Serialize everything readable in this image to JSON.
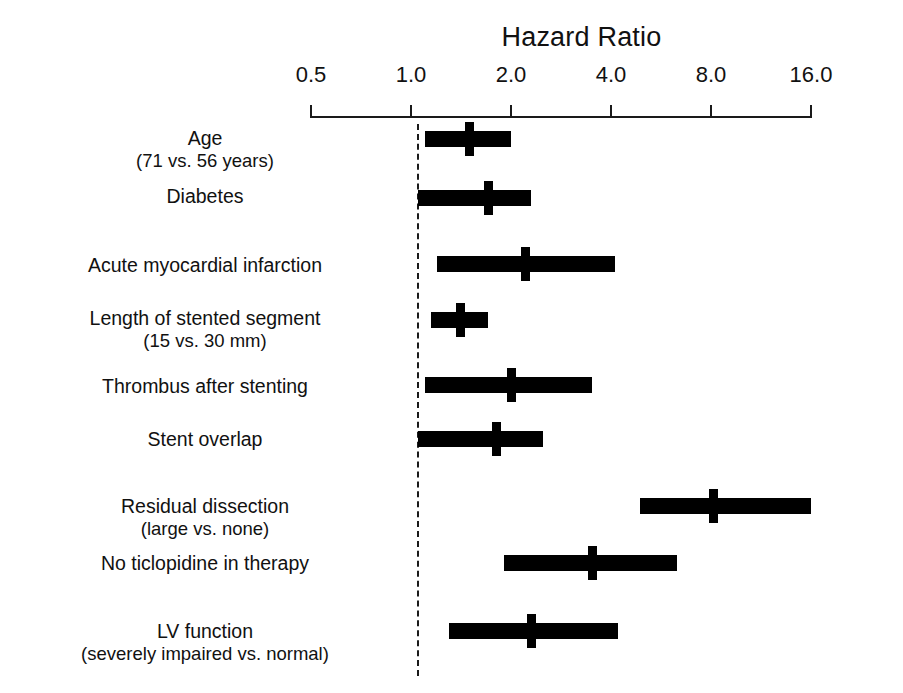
{
  "chart_data": {
    "type": "bar",
    "chart_kind": "forest-plot",
    "title": "Hazard Ratio",
    "xlabel": "Hazard Ratio",
    "ylabel": "",
    "xscale": "log2",
    "xlim": [
      0.5,
      16.0
    ],
    "grid": false,
    "legend": null,
    "reference_line": 1.0,
    "tick_labels": [
      "0.5",
      "1.0",
      "2.0",
      "4.0",
      "8.0",
      "16.0"
    ],
    "tick_values": [
      0.5,
      1.0,
      2.0,
      4.0,
      8.0,
      16.0
    ],
    "categories": [
      "Age (71 vs. 56 years)",
      "Diabetes",
      "Acute myocardial infarction",
      "Length of stented segment (15 vs. 30 mm)",
      "Thrombus after stenting",
      "Stent overlap",
      "Residual dissection (large vs. none)",
      "No ticlopidine in therapy",
      "LV function (severely impaired vs. normal)"
    ],
    "values": [
      1.5,
      1.7,
      2.2,
      1.4,
      2.0,
      1.8,
      8.1,
      3.5,
      2.3
    ],
    "ci_low": [
      1.1,
      1.05,
      1.2,
      1.15,
      1.1,
      1.05,
      4.9,
      1.9,
      1.3
    ],
    "ci_high": [
      2.0,
      2.3,
      4.1,
      1.7,
      3.5,
      2.5,
      16.0,
      6.3,
      4.2
    ]
  },
  "axis": {
    "title": "Hazard Ratio",
    "ticks": [
      {
        "label": "0.5",
        "value": 0.5
      },
      {
        "label": "1.0",
        "value": 1.0
      },
      {
        "label": "2.0",
        "value": 2.0
      },
      {
        "label": "4.0",
        "value": 4.0
      },
      {
        "label": "8.0",
        "value": 8.0
      },
      {
        "label": "16.0",
        "value": 16.0
      }
    ]
  },
  "rows": [
    {
      "label": "Age",
      "sublabel": "(71 vs. 56 years)",
      "hr": 1.5,
      "low": 1.1,
      "high": 2.0
    },
    {
      "label": "Diabetes",
      "sublabel": "",
      "hr": 1.7,
      "low": 1.05,
      "high": 2.3
    },
    {
      "label": "Acute myocardial infarction",
      "sublabel": "",
      "hr": 2.2,
      "low": 1.2,
      "high": 4.1
    },
    {
      "label": "Length of stented segment",
      "sublabel": "(15 vs. 30 mm)",
      "hr": 1.4,
      "low": 1.15,
      "high": 1.7
    },
    {
      "label": "Thrombus after stenting",
      "sublabel": "",
      "hr": 2.0,
      "low": 1.1,
      "high": 3.5
    },
    {
      "label": "Stent overlap",
      "sublabel": "",
      "hr": 1.8,
      "low": 1.05,
      "high": 2.5
    },
    {
      "label": "Residual dissection",
      "sublabel": "(large vs. none)",
      "hr": 8.1,
      "low": 4.9,
      "high": 16.0
    },
    {
      "label": "No ticlopidine in therapy",
      "sublabel": "",
      "hr": 3.5,
      "low": 1.9,
      "high": 6.3
    },
    {
      "label": "LV function",
      "sublabel": "(severely impaired vs. normal)",
      "hr": 2.3,
      "low": 1.3,
      "high": 4.2
    }
  ],
  "colors": {
    "bar": "#000000",
    "axis": "#1a1a1a",
    "text": "#111111",
    "background": "#ffffff"
  }
}
